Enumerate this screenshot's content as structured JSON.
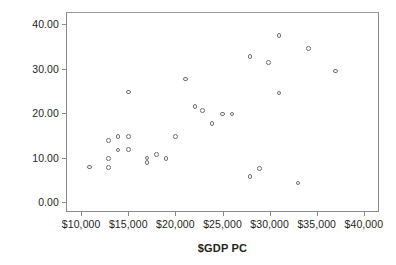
{
  "chart_data": {
    "type": "scatter",
    "title": "",
    "xlabel": "$GDP PC",
    "ylabel": "% in legis",
    "xlim": [
      8500,
      41500
    ],
    "ylim": [
      -2.0,
      42.5
    ],
    "grid": false,
    "legend": null,
    "x_tick_labels": [
      "$10,000",
      "$15,000",
      "$20,000",
      "$25,000",
      "$30,000",
      "$35,000",
      "$40,000"
    ],
    "x_tick_values": [
      10000,
      15000,
      20000,
      25000,
      30000,
      35000,
      40000
    ],
    "y_tick_labels": [
      "0.00",
      "10.00",
      "20.00",
      "30.00",
      "40.00"
    ],
    "y_tick_values": [
      0,
      10,
      20,
      30,
      40
    ],
    "marker": "open-circle",
    "marker_color": "#6e6e72",
    "points": [
      {
        "x": 10900,
        "y": 7.9
      },
      {
        "x": 12900,
        "y": 13.8
      },
      {
        "x": 12900,
        "y": 9.8
      },
      {
        "x": 12900,
        "y": 7.8
      },
      {
        "x": 13900,
        "y": 14.8
      },
      {
        "x": 13900,
        "y": 11.7
      },
      {
        "x": 15000,
        "y": 24.7
      },
      {
        "x": 15000,
        "y": 14.8
      },
      {
        "x": 15000,
        "y": 11.8
      },
      {
        "x": 17000,
        "y": 9.9
      },
      {
        "x": 17000,
        "y": 8.9
      },
      {
        "x": 18000,
        "y": 10.7
      },
      {
        "x": 19000,
        "y": 9.8
      },
      {
        "x": 20000,
        "y": 14.8
      },
      {
        "x": 21100,
        "y": 27.7
      },
      {
        "x": 22100,
        "y": 21.5
      },
      {
        "x": 22900,
        "y": 20.6
      },
      {
        "x": 23900,
        "y": 17.7
      },
      {
        "x": 25000,
        "y": 19.8
      },
      {
        "x": 26000,
        "y": 19.8
      },
      {
        "x": 27900,
        "y": 32.7
      },
      {
        "x": 27900,
        "y": 5.7
      },
      {
        "x": 28900,
        "y": 7.5
      },
      {
        "x": 29900,
        "y": 31.4
      },
      {
        "x": 31000,
        "y": 37.4
      },
      {
        "x": 31000,
        "y": 24.5
      },
      {
        "x": 33000,
        "y": 4.3
      },
      {
        "x": 34100,
        "y": 34.5
      },
      {
        "x": 37000,
        "y": 29.5
      }
    ]
  }
}
